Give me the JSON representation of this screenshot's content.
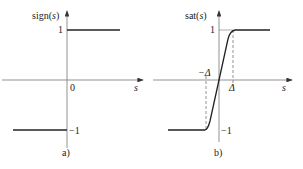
{
  "panels": [
    {
      "id": "a",
      "caption": "a)",
      "ylabel_prefix": "sign(",
      "ylabel_var": "s",
      "ylabel_suffix": ")",
      "xlabel": "s",
      "origin_label": "0",
      "tick_pos": "1",
      "tick_neg": "−1"
    },
    {
      "id": "b",
      "caption": "b)",
      "ylabel_prefix": "sat(",
      "ylabel_var": "s",
      "ylabel_suffix": ")",
      "xlabel": "s",
      "tick_pos": "1",
      "tick_neg": "−1",
      "delta_pos": "Δ",
      "delta_neg": "−Δ"
    }
  ],
  "colors": {
    "axis": "#777777",
    "curve": "#222222",
    "dash": "#666666"
  }
}
